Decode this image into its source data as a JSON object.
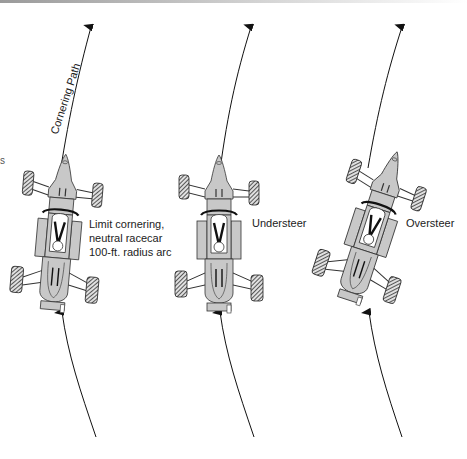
{
  "diagram": {
    "path_label": "Cornering Path",
    "edge_fragment": "s",
    "cars": [
      {
        "id": "neutral",
        "label_lines": [
          "Limit cornering,",
          "neutral racecar",
          "100-ft.  radius arc"
        ]
      },
      {
        "id": "understeer",
        "label_lines": [
          "Understeer"
        ]
      },
      {
        "id": "oversteer",
        "label_lines": [
          "Oversteer"
        ]
      }
    ],
    "colors": {
      "body": "#c8c8c8",
      "outline": "#333333",
      "tire": "#5a5a5a",
      "arrow": "#111111"
    }
  }
}
